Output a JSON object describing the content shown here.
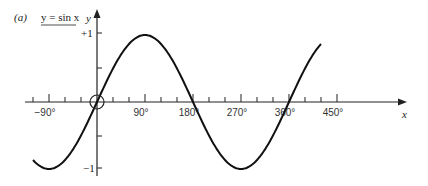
{
  "title": {
    "part": "(a)",
    "equation": "y = sin x"
  },
  "axes": {
    "x_label": "x",
    "y_label": "y",
    "y_plus": "+1",
    "y_minus": "−1"
  },
  "chart_data": {
    "type": "line",
    "title": "(a) y = sin x",
    "xlabel": "x",
    "ylabel": "y",
    "x_tick_labels": [
      "−90°",
      "90°",
      "180°",
      "270°",
      "360°",
      "450°"
    ],
    "x_tick_values": [
      -90,
      90,
      180,
      270,
      360,
      450
    ],
    "y_tick_labels": [
      "+1",
      "−1"
    ],
    "xlim": [
      -120,
      420
    ],
    "ylim": [
      -1,
      1
    ],
    "grid": false,
    "series": [
      {
        "name": "y = sin x",
        "function": "sin(x)",
        "x": [
          -120,
          -90,
          -60,
          -30,
          0,
          30,
          60,
          90,
          120,
          150,
          180,
          210,
          240,
          270,
          300,
          330,
          360,
          390,
          420
        ],
        "y": [
          -0.87,
          -1,
          -0.87,
          -0.5,
          0,
          0.5,
          0.87,
          1,
          0.87,
          0.5,
          0,
          -0.5,
          -0.87,
          -1,
          -0.87,
          -0.5,
          0,
          0.5,
          0.87
        ]
      }
    ],
    "annotations": [
      "circle at origin"
    ]
  }
}
